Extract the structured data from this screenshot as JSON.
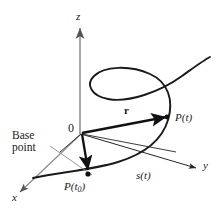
{
  "figure": {
    "kind": "math-diagram-3d-space-curve",
    "background_color": "#ffffff",
    "ink_color": "#1a1a1a",
    "axis_color": "#808080",
    "width": 221,
    "height": 214,
    "axes": [
      {
        "name": "x",
        "label": "x",
        "direction": "down-left"
      },
      {
        "name": "y",
        "label": "y",
        "direction": "right"
      },
      {
        "name": "z",
        "label": "z",
        "direction": "up"
      }
    ],
    "origin_label": "0",
    "points": [
      {
        "name": "base-point",
        "label_main": "P(t",
        "label_sub": "0",
        "label_close": ")"
      },
      {
        "name": "current-point",
        "label_main": "P(t",
        "label_sub": "",
        "label_close": ")"
      }
    ],
    "labels": {
      "x_axis": "x",
      "y_axis": "y",
      "z_axis": "z",
      "origin": "0",
      "position_vector": "r",
      "arc_length": "s(t)",
      "point_t": "P(t)",
      "point_t0_main": "P(t",
      "point_t0_sub": "0",
      "point_t0_close": ")",
      "annotation_line1": "Base",
      "annotation_line2": "point"
    }
  }
}
